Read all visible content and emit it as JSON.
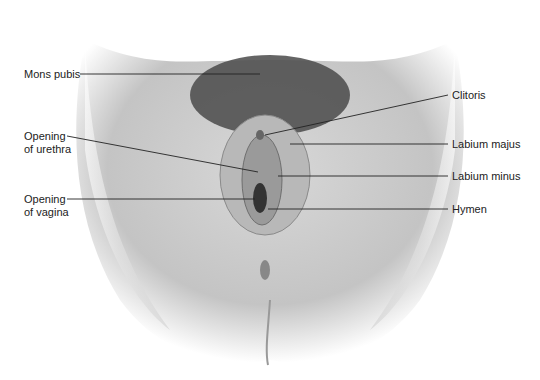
{
  "diagram": {
    "labels_left": [
      {
        "id": "mons-pubis",
        "text": "Mons pubis",
        "x": 24,
        "y": 68
      },
      {
        "id": "opening-urethra",
        "text": "Opening\nof urethra",
        "x": 24,
        "y": 130
      },
      {
        "id": "opening-vagina",
        "text": "Opening\nof vagina",
        "x": 24,
        "y": 193
      }
    ],
    "labels_right": [
      {
        "id": "clitoris",
        "text": "Clitoris",
        "x": 452,
        "y": 89
      },
      {
        "id": "labium-majus",
        "text": "Labium majus",
        "x": 452,
        "y": 138
      },
      {
        "id": "labium-minus",
        "text": "Labium minus",
        "x": 452,
        "y": 170
      },
      {
        "id": "hymen",
        "text": "Hymen",
        "x": 452,
        "y": 203
      }
    ]
  }
}
